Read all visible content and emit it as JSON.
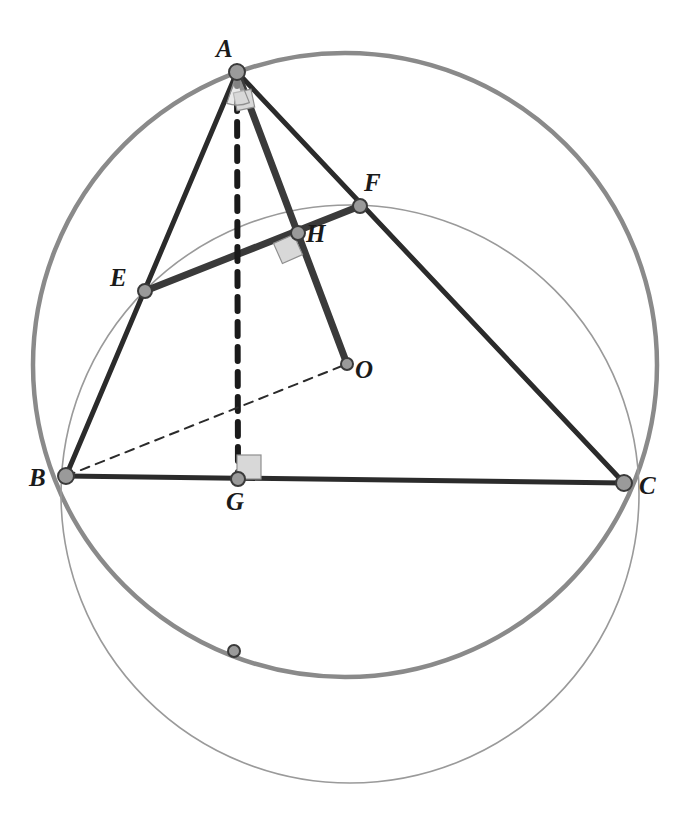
{
  "figure": {
    "width": 679,
    "height": 813,
    "background": "#ffffff"
  },
  "colors": {
    "stroke_dark": "#2b2b2b",
    "stroke_black": "#1a1a1a",
    "circle_thick_gray": "#8a8a8a",
    "circle_thin_gray": "#9a9a9a",
    "vertex_fill": "#9a9a9a",
    "vertex_stroke": "#3a3a3a",
    "right_angle_fill": "#d8d8d8",
    "right_angle_stroke": "#8f8f8f",
    "label_color": "#1a1a1a"
  },
  "points": [
    {
      "id": "A",
      "label": "A",
      "x": 237,
      "y": 72,
      "label_x": 216,
      "label_y": 36,
      "radius": 8,
      "kind": "vertex"
    },
    {
      "id": "B",
      "label": "B",
      "x": 66,
      "y": 476,
      "label_x": 29,
      "label_y": 465,
      "radius": 8,
      "kind": "vertex"
    },
    {
      "id": "C",
      "label": "C",
      "x": 624,
      "y": 483,
      "label_x": 639,
      "label_y": 473,
      "radius": 8,
      "kind": "vertex"
    },
    {
      "id": "E",
      "label": "E",
      "x": 145,
      "y": 291,
      "label_x": 110,
      "label_y": 265,
      "radius": 7,
      "kind": "midpoint"
    },
    {
      "id": "F",
      "label": "F",
      "x": 360,
      "y": 206,
      "label_x": 364,
      "label_y": 170,
      "radius": 7,
      "kind": "midpoint"
    },
    {
      "id": "G",
      "label": "G",
      "x": 238,
      "y": 479,
      "label_x": 226,
      "label_y": 489,
      "radius": 7,
      "kind": "foot"
    },
    {
      "id": "H",
      "label": "H",
      "x": 298,
      "y": 233,
      "label_x": 306,
      "label_y": 221,
      "radius": 7,
      "kind": "intersection"
    },
    {
      "id": "O",
      "label": "O",
      "x": 347,
      "y": 364,
      "label_x": 355,
      "label_y": 357,
      "radius": 6,
      "kind": "center"
    },
    {
      "id": "P",
      "label": "",
      "x": 234,
      "y": 651,
      "label_x": 0,
      "label_y": 0,
      "radius": 6,
      "kind": "arc-point"
    }
  ],
  "segments": [
    {
      "id": "AB",
      "from": "A",
      "to": "B",
      "style": "solid",
      "weight": 5,
      "color": "#2b2b2b"
    },
    {
      "id": "AC",
      "from": "A",
      "to": "C",
      "style": "solid",
      "weight": 5,
      "color": "#2b2b2b"
    },
    {
      "id": "BC",
      "from": "B",
      "to": "C",
      "style": "solid",
      "weight": 5,
      "color": "#2b2b2b"
    },
    {
      "id": "EF",
      "from": "E",
      "to": "F",
      "style": "solid",
      "weight": 7,
      "color": "#3a3a3a"
    },
    {
      "id": "AO",
      "from": "A",
      "to": "O",
      "style": "solid",
      "weight": 7,
      "color": "#3a3a3a"
    },
    {
      "id": "AG",
      "from": "A",
      "to": "G",
      "style": "dashed",
      "weight": 6,
      "color": "#1a1a1a",
      "dash": "14 11"
    },
    {
      "id": "BO",
      "from": "B",
      "to": "O",
      "style": "dashed",
      "weight": 2,
      "color": "#2b2b2b",
      "dash": "9 7"
    }
  ],
  "circles": [
    {
      "id": "circumcircle",
      "cx": 345,
      "cy": 365,
      "r": 312,
      "weight": 4.5,
      "color": "#8a8a8a"
    },
    {
      "id": "second-circle",
      "cx": 350,
      "cy": 494,
      "r": 289,
      "weight": 1.6,
      "color": "#9a9a9a"
    }
  ],
  "right_angles": [
    {
      "id": "right-angle-at-A",
      "cx": 244,
      "cy": 100,
      "size": 18,
      "rotate": -12
    },
    {
      "id": "right-angle-at-H",
      "cx": 288,
      "cy": 249,
      "size": 22,
      "rotate": -24
    },
    {
      "id": "right-angle-at-G",
      "cx": 249,
      "cy": 467,
      "size": 24,
      "rotate": 0
    }
  ],
  "angle_arc": {
    "id": "angle-arc-at-A",
    "cx": 237,
    "cy": 72,
    "r": 33,
    "start_deg": 68,
    "end_deg": 108
  },
  "labels": {
    "A": "A",
    "B": "B",
    "C": "C",
    "E": "E",
    "F": "F",
    "G": "G",
    "H": "H",
    "O": "O"
  }
}
